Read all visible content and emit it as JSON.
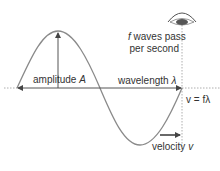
{
  "diagram": {
    "labels": {
      "amplitude_text": "amplitude ",
      "amplitude_symbol": "A",
      "wavelength_text": "wavelength ",
      "wavelength_symbol": "λ",
      "frequency_line1_symbol": "f",
      "frequency_line1_text": " waves pass",
      "frequency_line2": "per second",
      "equation": "v = fλ",
      "velocity_text": "velocity ",
      "velocity_symbol": "v"
    },
    "icons": {
      "observer": "eye-icon",
      "direction": "arrow-right-icon"
    },
    "colors": {
      "wave": "#8a8a8a",
      "axis": "#555555",
      "text": "#333333",
      "eye": "#555555",
      "dotted": "#999999"
    }
  }
}
